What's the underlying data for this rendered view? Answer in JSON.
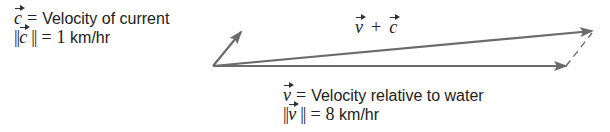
{
  "diagram": {
    "type": "vector-addition",
    "colors": {
      "arrow": "#6b6b6b",
      "text": "#222222",
      "background": "#ffffff"
    },
    "current": {
      "symbol": "c",
      "eq": "=",
      "description": "Velocity of current",
      "norm_open": "||",
      "norm_close": "||",
      "magnitude_value": "1",
      "magnitude_unit": "km/hr"
    },
    "sum": {
      "symbol_v": "v",
      "plus": "+",
      "symbol_c": "c"
    },
    "velocity": {
      "symbol": "v",
      "eq": "=",
      "description": "Velocity relative to water",
      "norm_open": "||",
      "norm_close": "||",
      "magnitude_value": "8",
      "magnitude_unit": "km/hr"
    },
    "vectors": [
      {
        "name": "c",
        "from": [
          213,
          66
        ],
        "to": [
          241,
          32
        ],
        "style": "solid"
      },
      {
        "name": "v",
        "from": [
          213,
          66
        ],
        "to": [
          566,
          66
        ],
        "style": "solid"
      },
      {
        "name": "v+c",
        "from": [
          213,
          66
        ],
        "to": [
          592,
          31
        ],
        "style": "solid"
      },
      {
        "name": "c-translated",
        "from": [
          566,
          66
        ],
        "to": [
          592,
          31
        ],
        "style": "dashed"
      }
    ]
  }
}
